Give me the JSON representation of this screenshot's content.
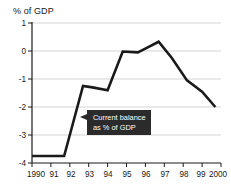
{
  "chart_data": {
    "type": "line",
    "title": "",
    "ylabel": "% of GDP",
    "xlabel": "",
    "ylim": [
      -4,
      1
    ],
    "yticks": [
      1,
      0,
      -1,
      -2,
      -3,
      -4
    ],
    "ytick_labels": [
      "1",
      "0",
      "-1",
      "-2",
      "-3",
      "-4"
    ],
    "xlim": [
      1990,
      2000
    ],
    "xticks": [
      1990,
      1991,
      1992,
      1993,
      1994,
      1995,
      1996,
      1997,
      1998,
      1999,
      2000
    ],
    "xtick_labels": [
      "1990",
      "91",
      "92",
      "93",
      "94",
      "95",
      "96",
      "97",
      "98",
      "99",
      "2000"
    ],
    "grid": true,
    "legend": "none",
    "series": [
      {
        "name": "Current balance as % of GDP",
        "color": "#1a1a1a",
        "x": [
          1990,
          1991,
          1991.7,
          1992.7,
          1993.2,
          1994.0,
          1994.8,
          1995.6,
          1996.1,
          1996.7,
          1997.4,
          1998.2,
          1999.0,
          1999.7
        ],
        "values": [
          -3.75,
          -3.75,
          -3.75,
          -1.25,
          -1.3,
          -1.4,
          -0.02,
          -0.05,
          0.12,
          0.33,
          -0.25,
          -1.05,
          -1.45,
          -2.0
        ]
      }
    ],
    "annotations": [
      {
        "name": "series-callout",
        "line1": "Current balance",
        "line2": "as % of GDP",
        "background": "#2b2b2b",
        "text_color": "#ffffff",
        "points_to": "line at about 1993, -2.6"
      }
    ]
  },
  "axis": {
    "ylabel_text": "% of GDP"
  }
}
